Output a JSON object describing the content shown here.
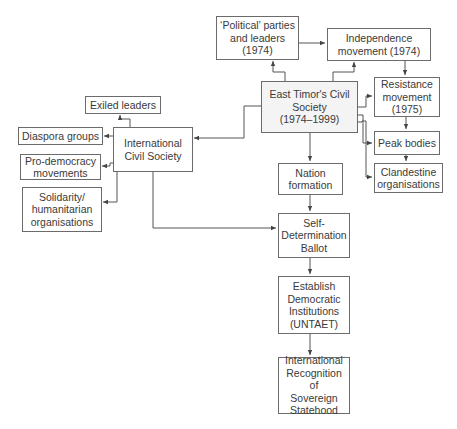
{
  "diagram": {
    "nodes": {
      "political_parties": "‘Political’ parties\nand leaders\n(1974)",
      "independence": "Independence\nmovement (1974)",
      "east_timor_cs": "East Timor's Civil\nSociety\n(1974–1999)",
      "resistance": "Resistance\nmovement\n(1975)",
      "peak_bodies": "Peak bodies",
      "clandestine": "Clandestine\norganisations",
      "exiled_leaders": "Exiled leaders",
      "diaspora": "Diaspora groups",
      "international_cs": "International\nCivil Society",
      "pro_democracy": "Pro-democracy\nmovements",
      "solidarity": "Solidarity/\nhumanitarian\norganisations",
      "nation_formation": "Nation\nformation",
      "ballot": "Self-\nDetermination\nBallot",
      "democratic_institutions": "Establish\nDemocratic\nInstitutions\n(UNTAET)",
      "recognition": "International\nRecognition of\nSovereign\nStatehood"
    },
    "edges": [
      [
        "east_timor_cs",
        "political_parties"
      ],
      [
        "east_timor_cs",
        "independence"
      ],
      [
        "political_parties",
        "independence"
      ],
      [
        "independence",
        "resistance"
      ],
      [
        "east_timor_cs",
        "resistance"
      ],
      [
        "resistance",
        "peak_bodies"
      ],
      [
        "east_timor_cs",
        "peak_bodies"
      ],
      [
        "peak_bodies",
        "clandestine"
      ],
      [
        "east_timor_cs",
        "clandestine"
      ],
      [
        "east_timor_cs",
        "international_cs"
      ],
      [
        "international_cs",
        "exiled_leaders"
      ],
      [
        "international_cs",
        "diaspora"
      ],
      [
        "international_cs",
        "pro_democracy"
      ],
      [
        "international_cs",
        "solidarity"
      ],
      [
        "east_timor_cs",
        "nation_formation"
      ],
      [
        "nation_formation",
        "ballot"
      ],
      [
        "international_cs",
        "ballot"
      ],
      [
        "ballot",
        "democratic_institutions"
      ],
      [
        "democratic_institutions",
        "recognition"
      ]
    ]
  }
}
